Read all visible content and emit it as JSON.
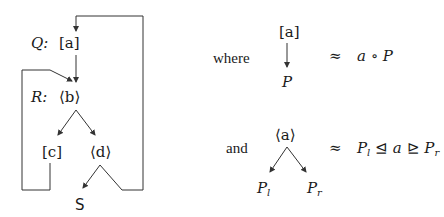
{
  "diagram": {
    "left": {
      "nodes": {
        "q_label": "Q:",
        "q_node": "[a]",
        "r_label": "R:",
        "r_node": "⟨b⟩",
        "c_node": "[c]",
        "d_node": "⟨d⟩",
        "s_node": "S"
      }
    },
    "right": {
      "where_word": "where",
      "where_top": "[a]",
      "where_bottom": "P",
      "where_approx": "≈",
      "where_rhs": "a ∘ P",
      "and_word": "and",
      "and_top": "⟨a⟩",
      "and_left_base": "P",
      "and_left_sub": "l",
      "and_right_base": "P",
      "and_right_sub": "r",
      "and_approx": "≈",
      "and_rhs_p1": "P",
      "and_rhs_sub1": "l",
      "and_rhs_rel1": " ⊴ ",
      "and_rhs_a": "a",
      "and_rhs_rel2": " ⊵ ",
      "and_rhs_p2": "P",
      "and_rhs_sub2": "r"
    },
    "colors": {
      "line": "#333333",
      "text": "#1a1a1a"
    }
  }
}
